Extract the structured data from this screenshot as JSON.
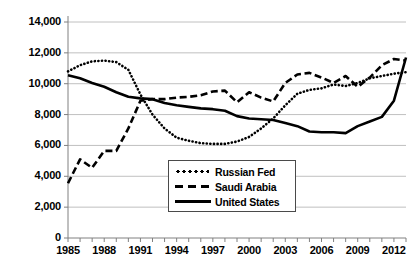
{
  "chart_data": {
    "type": "line",
    "title": "",
    "subtitle": "",
    "xlabel": "",
    "ylabel": "",
    "xlim": [
      1985,
      2013
    ],
    "ylim": [
      0,
      14000
    ],
    "grid": true,
    "legend_position": "inside-bottom-center",
    "y_ticks": [
      "0",
      "2,000",
      "4,000",
      "6,000",
      "8,000",
      "10,000",
      "12,000",
      "14,000"
    ],
    "y_tick_values": [
      0,
      2000,
      4000,
      6000,
      8000,
      10000,
      12000,
      14000
    ],
    "x_ticks": [
      "1985",
      "1988",
      "1991",
      "1994",
      "1997",
      "2000",
      "2003",
      "2006",
      "2009",
      "2012"
    ],
    "x_tick_values": [
      1985,
      1988,
      1991,
      1994,
      1997,
      2000,
      2003,
      2006,
      2009,
      2012
    ],
    "x": [
      1985,
      1986,
      1987,
      1988,
      1989,
      1990,
      1991,
      1992,
      1993,
      1994,
      1995,
      1996,
      1997,
      1998,
      1999,
      2000,
      2001,
      2002,
      2003,
      2004,
      2005,
      2006,
      2007,
      2008,
      2009,
      2010,
      2011,
      2012,
      2013
    ],
    "series": [
      {
        "name": "Russian Fed",
        "style": "dotted",
        "color": "#000000",
        "values": [
          10800,
          11200,
          11450,
          11500,
          11400,
          10900,
          9300,
          8000,
          7100,
          6500,
          6300,
          6150,
          6100,
          6100,
          6250,
          6550,
          7100,
          7750,
          8600,
          9350,
          9600,
          9700,
          9950,
          9850,
          10050,
          10350,
          10500,
          10650,
          10750
        ]
      },
      {
        "name": "Saudi Arabia",
        "style": "dashed",
        "color": "#000000",
        "values": [
          3550,
          5100,
          4550,
          5650,
          5650,
          7100,
          8900,
          9000,
          9000,
          9100,
          9150,
          9250,
          9500,
          9550,
          8800,
          9450,
          9100,
          8850,
          10050,
          10600,
          10700,
          10400,
          10050,
          10500,
          9800,
          10400,
          11200,
          11600,
          11500
        ]
      },
      {
        "name": "United States",
        "style": "solid",
        "color": "#000000",
        "values": [
          10550,
          10350,
          10050,
          9800,
          9450,
          9150,
          9050,
          9000,
          8750,
          8600,
          8500,
          8400,
          8350,
          8250,
          7900,
          7750,
          7700,
          7650,
          7450,
          7250,
          6900,
          6850,
          6850,
          6800,
          7250,
          7550,
          7850,
          8900,
          11700
        ]
      }
    ]
  },
  "legend": {
    "items": [
      {
        "label": "Russian Fed",
        "key": "dotted-line-key"
      },
      {
        "label": "Saudi Arabia",
        "key": "dashed-line-key"
      },
      {
        "label": "United States",
        "key": "solid-line-key"
      }
    ]
  }
}
